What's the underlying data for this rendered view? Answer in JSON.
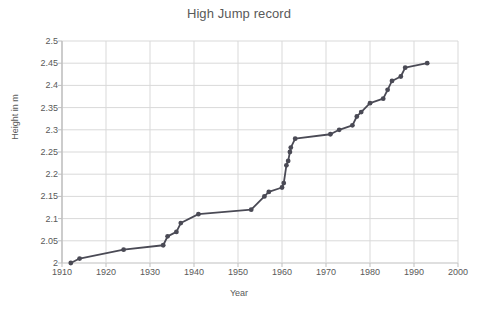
{
  "chart_data": {
    "type": "line",
    "title": "High Jump record",
    "xlabel": "Year",
    "ylabel": "Height in m",
    "xlim": [
      1910,
      2000
    ],
    "ylim": [
      2,
      2.5
    ],
    "xticks": [
      1910,
      1920,
      1930,
      1940,
      1950,
      1960,
      1970,
      1980,
      1990,
      2000
    ],
    "yticks": [
      2,
      2.05,
      2.1,
      2.15,
      2.2,
      2.25,
      2.3,
      2.35,
      2.4,
      2.45,
      2.5
    ],
    "xtick_labels": [
      "1910",
      "1920",
      "1930",
      "1940",
      "1950",
      "1960",
      "1970",
      "1980",
      "1990",
      "2000"
    ],
    "ytick_labels": [
      "2",
      "2.05",
      "2.1",
      "2.15",
      "2.2",
      "2.25",
      "2.3",
      "2.35",
      "2.4",
      "2.45",
      "2.5"
    ],
    "grid": true,
    "grid_axis": "both",
    "legend": false,
    "markers": true,
    "series": [
      {
        "name": "High Jump world record",
        "color": "#4a4a55",
        "x": [
          1912,
          1914,
          1924,
          1933,
          1934,
          1936,
          1937,
          1941,
          1953,
          1956,
          1957,
          1960,
          1960.4,
          1961,
          1961.4,
          1961.8,
          1962,
          1963,
          1971,
          1973,
          1976,
          1977,
          1978,
          1980,
          1983,
          1984,
          1985,
          1987,
          1988,
          1993
        ],
        "y": [
          2.0,
          2.01,
          2.03,
          2.04,
          2.06,
          2.07,
          2.09,
          2.11,
          2.12,
          2.15,
          2.16,
          2.17,
          2.18,
          2.22,
          2.23,
          2.25,
          2.26,
          2.28,
          2.29,
          2.3,
          2.31,
          2.33,
          2.34,
          2.36,
          2.37,
          2.39,
          2.41,
          2.42,
          2.44,
          2.45
        ]
      }
    ]
  },
  "style": {
    "line_color": "#4a4a55",
    "marker_color": "#4a4a55",
    "grid_color": "#d9d9d9",
    "axis_color": "#bfbfbf",
    "text_color": "#595959",
    "background": "#ffffff"
  }
}
